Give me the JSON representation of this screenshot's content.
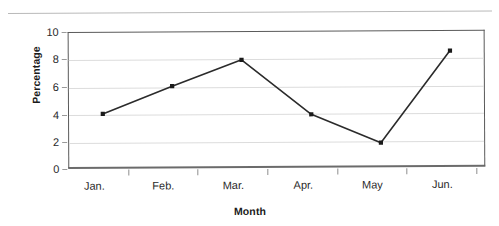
{
  "chart_data": {
    "type": "line",
    "title": "",
    "subtitle": "",
    "xlabel": "Month",
    "ylabel": "Percentage",
    "categories": [
      "Jan.",
      "Feb.",
      "Mar.",
      "Apr.",
      "May",
      "Jun."
    ],
    "values": [
      4.0,
      6.0,
      7.9,
      3.9,
      1.8,
      8.5
    ],
    "series": [
      {
        "name": "Percentage",
        "values": [
          4.0,
          6.0,
          7.9,
          3.9,
          1.8,
          8.5
        ]
      }
    ],
    "ylim": [
      0,
      10
    ],
    "ytick_labels": [
      "0",
      "2",
      "4",
      "6",
      "8",
      "10"
    ],
    "ytick_values": [
      0,
      2,
      4,
      6,
      8,
      10
    ],
    "grid": "horizontal",
    "legend": "none",
    "marker": "square",
    "line_color": "#2b2b2b",
    "marker_color": "#1a1a1a",
    "gridline_color": "#dcdcdc",
    "frame_color": "#5a5a5a"
  },
  "axis": {
    "y_title": "Percentage",
    "x_title": "Month",
    "y_ticks": [
      {
        "label": "10",
        "value": 10
      },
      {
        "label": "8",
        "value": 8
      },
      {
        "label": "6",
        "value": 6
      },
      {
        "label": "4",
        "value": 4
      },
      {
        "label": "2",
        "value": 2
      },
      {
        "label": "0",
        "value": 0
      }
    ],
    "x_ticks": [
      {
        "label": "Jan."
      },
      {
        "label": "Feb."
      },
      {
        "label": "Mar."
      },
      {
        "label": "Apr."
      },
      {
        "label": "May"
      },
      {
        "label": "Jun."
      }
    ]
  }
}
